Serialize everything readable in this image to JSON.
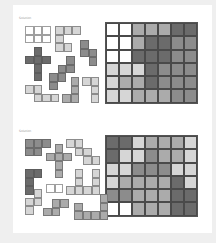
{
  "colors": {
    "W": "#ffffff",
    "L": "#d6d6d6",
    "M": "#ababab",
    "D": "#8c8c8c",
    "X": "#6b6b6b",
    "background": "#efefef",
    "panel": "#ffffff"
  },
  "puzzles": [
    {
      "label": "Solution",
      "grid": {
        "cols": 7,
        "rows": 6,
        "cells": [
          [
            "W",
            "W",
            "M",
            "M",
            "M",
            "X",
            "X"
          ],
          [
            "W",
            "W",
            "M",
            "X",
            "X",
            "D",
            "D"
          ],
          [
            "W",
            "W",
            "X",
            "X",
            "X",
            "D",
            "D"
          ],
          [
            "L",
            "L",
            "L",
            "X",
            "D",
            "D",
            "D"
          ],
          [
            "L",
            "M",
            "M",
            "X",
            "D",
            "D",
            "D"
          ],
          [
            "L",
            "L",
            "M",
            "M",
            "M",
            "D",
            "D"
          ]
        ]
      },
      "pieces": [
        {
          "shade": "W",
          "x": 25,
          "y": 26,
          "cells": [
            [
              0,
              0
            ],
            [
              1,
              0
            ],
            [
              2,
              0
            ],
            [
              0,
              1
            ],
            [
              1,
              1
            ],
            [
              2,
              1
            ]
          ]
        },
        {
          "shade": "L",
          "x": 55,
          "y": 26,
          "cells": [
            [
              0,
              0
            ],
            [
              1,
              0
            ],
            [
              2,
              0
            ],
            [
              0,
              1
            ],
            [
              0,
              2
            ],
            [
              1,
              2
            ]
          ]
        },
        {
          "shade": "D",
          "x": 80,
          "y": 40,
          "cells": [
            [
              0,
              0
            ],
            [
              0,
              1
            ],
            [
              1,
              1
            ],
            [
              1,
              2
            ]
          ]
        },
        {
          "shade": "X",
          "x": 25,
          "y": 47,
          "cells": [
            [
              1,
              0
            ],
            [
              0,
              1
            ],
            [
              1,
              1
            ],
            [
              2,
              1
            ],
            [
              1,
              2
            ],
            [
              1,
              3
            ]
          ]
        },
        {
          "shade": "D",
          "x": 49,
          "y": 56,
          "cells": [
            [
              2,
              0
            ],
            [
              1,
              1
            ],
            [
              2,
              1
            ],
            [
              0,
              2
            ],
            [
              1,
              2
            ],
            [
              0,
              3
            ]
          ]
        },
        {
          "shade": "M",
          "x": 62,
          "y": 77,
          "cells": [
            [
              1,
              0
            ],
            [
              1,
              1
            ],
            [
              0,
              2
            ],
            [
              1,
              2
            ]
          ]
        },
        {
          "shade": "L",
          "x": 82,
          "y": 77,
          "cells": [
            [
              0,
              0
            ],
            [
              1,
              0
            ],
            [
              1,
              1
            ],
            [
              1,
              2
            ]
          ]
        },
        {
          "shade": "L",
          "x": 25,
          "y": 85,
          "cells": [
            [
              0,
              0
            ],
            [
              1,
              0
            ],
            [
              1,
              1
            ],
            [
              2,
              1
            ],
            [
              3,
              1
            ]
          ]
        },
        {
          "shade": "M",
          "x": 62,
          "y": 94,
          "cells": [
            [
              0,
              0
            ],
            [
              1,
              0
            ]
          ]
        }
      ]
    },
    {
      "label": "Solution",
      "grid": {
        "cols": 7,
        "rows": 6,
        "cells": [
          [
            "X",
            "X",
            "L",
            "M",
            "M",
            "M",
            "L"
          ],
          [
            "X",
            "L",
            "L",
            "D",
            "M",
            "M",
            "L"
          ],
          [
            "L",
            "L",
            "D",
            "D",
            "D",
            "L",
            "L"
          ],
          [
            "L",
            "M",
            "M",
            "M",
            "M",
            "X",
            "L"
          ],
          [
            "D",
            "D",
            "M",
            "M",
            "M",
            "X",
            "X"
          ],
          [
            "W",
            "W",
            "M",
            "M",
            "M",
            "X",
            "X"
          ]
        ]
      },
      "pieces": [
        {
          "shade": "D",
          "x": 25,
          "y": 139,
          "cells": [
            [
              0,
              0
            ],
            [
              1,
              0
            ],
            [
              2,
              0
            ],
            [
              0,
              1
            ],
            [
              1,
              1
            ]
          ]
        },
        {
          "shade": "M",
          "x": 46,
          "y": 144,
          "cells": [
            [
              1,
              0
            ],
            [
              0,
              1
            ],
            [
              1,
              1
            ],
            [
              2,
              1
            ],
            [
              1,
              2
            ],
            [
              1,
              3
            ]
          ]
        },
        {
          "shade": "L",
          "x": 66,
          "y": 139,
          "cells": [
            [
              0,
              0
            ],
            [
              1,
              0
            ],
            [
              1,
              1
            ],
            [
              2,
              1
            ],
            [
              2,
              2
            ],
            [
              3,
              2
            ]
          ]
        },
        {
          "shade": "X",
          "x": 25,
          "y": 169,
          "cells": [
            [
              0,
              0
            ],
            [
              1,
              0
            ],
            [
              0,
              1
            ],
            [
              0,
              2
            ]
          ]
        },
        {
          "shade": "W",
          "x": 46,
          "y": 184,
          "cells": [
            [
              0,
              0
            ],
            [
              1,
              0
            ]
          ]
        },
        {
          "shade": "L",
          "x": 66,
          "y": 169,
          "cells": [
            [
              1,
              0
            ],
            [
              3,
              0
            ],
            [
              1,
              1
            ],
            [
              3,
              1
            ],
            [
              0,
              2
            ],
            [
              1,
              2
            ],
            [
              2,
              2
            ],
            [
              3,
              2
            ]
          ]
        },
        {
          "shade": "L",
          "x": 25,
          "y": 189,
          "cells": [
            [
              1,
              0
            ],
            [
              0,
              1
            ],
            [
              1,
              1
            ],
            [
              0,
              2
            ]
          ]
        },
        {
          "shade": "M",
          "x": 43,
          "y": 199,
          "cells": [
            [
              1,
              0
            ],
            [
              2,
              0
            ],
            [
              0,
              1
            ],
            [
              1,
              1
            ]
          ]
        },
        {
          "shade": "M",
          "x": 74,
          "y": 194,
          "cells": [
            [
              3,
              0
            ],
            [
              0,
              1
            ],
            [
              3,
              1
            ],
            [
              0,
              2
            ],
            [
              1,
              2
            ],
            [
              2,
              2
            ],
            [
              3,
              2
            ]
          ]
        }
      ]
    }
  ]
}
